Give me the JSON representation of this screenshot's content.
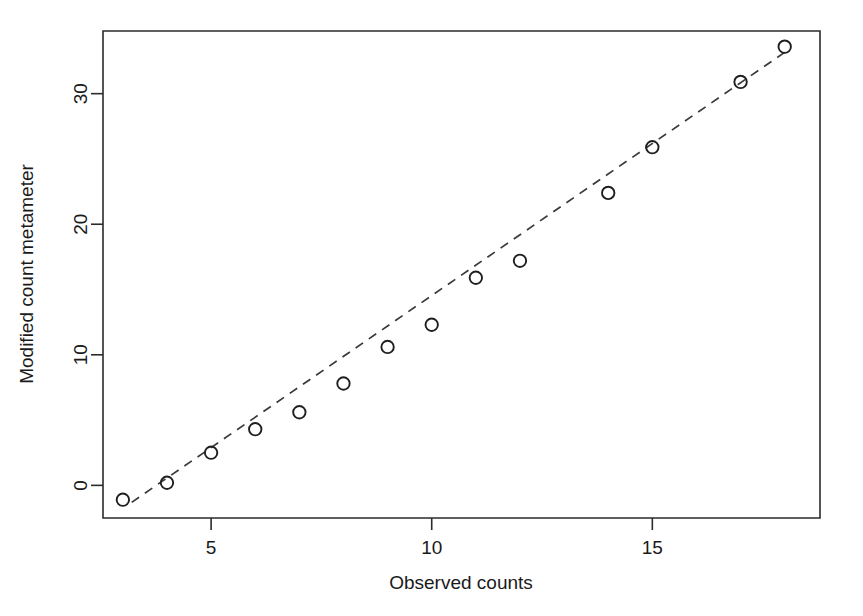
{
  "chart_data": {
    "type": "scatter",
    "title": "",
    "xlabel": "Observed counts",
    "ylabel": "Modified count metameter",
    "xlim": [
      2.55,
      18.8
    ],
    "ylim": [
      -2.5,
      34.8
    ],
    "xticks": [
      5,
      10,
      15
    ],
    "xticklabels": [
      "5",
      "10",
      "15"
    ],
    "yticks": [
      0,
      10,
      20,
      30
    ],
    "yticklabels": [
      "0",
      "10",
      "20",
      "30"
    ],
    "grid": false,
    "legend": null,
    "marker": "open-circle",
    "x": [
      3,
      4,
      5,
      6,
      7,
      8,
      9,
      10,
      11,
      12,
      14,
      15,
      17,
      18
    ],
    "y": [
      -1.1,
      0.2,
      2.5,
      4.3,
      5.6,
      7.8,
      10.6,
      12.3,
      15.9,
      17.2,
      22.4,
      25.9,
      30.9,
      33.6
    ],
    "points": [
      {
        "x": 3,
        "y": -1.1
      },
      {
        "x": 4,
        "y": 0.2
      },
      {
        "x": 5,
        "y": 2.5
      },
      {
        "x": 6,
        "y": 4.3
      },
      {
        "x": 7,
        "y": 5.6
      },
      {
        "x": 8,
        "y": 7.8
      },
      {
        "x": 9,
        "y": 10.6
      },
      {
        "x": 10,
        "y": 12.3
      },
      {
        "x": 11,
        "y": 15.9
      },
      {
        "x": 12,
        "y": 17.2
      },
      {
        "x": 14,
        "y": 22.4
      },
      {
        "x": 15,
        "y": 25.9
      },
      {
        "x": 17,
        "y": 30.9
      },
      {
        "x": 18,
        "y": 33.6
      }
    ],
    "reference_line": {
      "style": "dashed",
      "x0": 3.2,
      "y0": -1.3,
      "x1": 18.1,
      "y1": 33.4
    },
    "colors": {
      "marker_stroke": "#1f1f1f",
      "line": "#3a3a3a",
      "axis": "#2b2b2b",
      "background": "#ffffff"
    }
  }
}
